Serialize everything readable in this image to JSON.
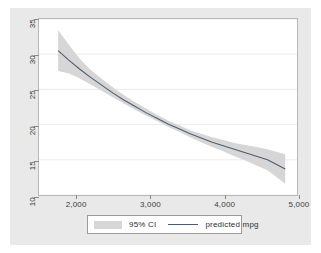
{
  "chart_data": {
    "type": "line",
    "title": "",
    "subtitle": "",
    "xlabel": "Weight (lbs.)",
    "ylabel": "",
    "xlim": [
      1500,
      5000
    ],
    "ylim": [
      10,
      35
    ],
    "xticks": [
      2000,
      3000,
      4000,
      5000
    ],
    "xticklabels": [
      "2,000",
      "3,000",
      "4,000",
      "5,000"
    ],
    "yticks": [
      10,
      15,
      20,
      25,
      30,
      35
    ],
    "yticklabels": [
      "10",
      "15",
      "20",
      "25",
      "30",
      "35"
    ],
    "grid": "horizontal",
    "legend_position": "bottom",
    "legend": [
      {
        "label": "95% CI",
        "marker": "band",
        "color": "#d6d6d6"
      },
      {
        "label": "predicted mpg",
        "marker": "line",
        "color": "#4e5d6e"
      }
    ],
    "series": [
      {
        "name": "predicted mpg",
        "type": "line",
        "color": "#4e5d6e",
        "x": [
          1760,
          1900,
          2050,
          2200,
          2350,
          2500,
          2650,
          2800,
          2950,
          3100,
          3250,
          3400,
          3550,
          3700,
          3850,
          4000,
          4150,
          4300,
          4450,
          4600,
          4840
        ],
        "y": [
          30.5,
          29.2,
          27.9,
          26.7,
          25.6,
          24.5,
          23.5,
          22.6,
          21.7,
          20.9,
          20.1,
          19.4,
          18.7,
          18.1,
          17.5,
          17.0,
          16.5,
          16.0,
          15.5,
          15.0,
          13.7
        ]
      },
      {
        "name": "95% CI",
        "type": "band",
        "color": "#d6d6d6",
        "x": [
          1760,
          1900,
          2050,
          2200,
          2350,
          2500,
          2650,
          2800,
          2950,
          3100,
          3250,
          3400,
          3550,
          3700,
          3850,
          4000,
          4150,
          4300,
          4450,
          4600,
          4840
        ],
        "lower": [
          27.6,
          27.3,
          26.6,
          25.7,
          24.8,
          23.9,
          23.0,
          22.1,
          21.3,
          20.5,
          19.7,
          19.0,
          18.2,
          17.5,
          16.8,
          16.2,
          15.5,
          14.9,
          14.2,
          13.5,
          11.6
        ],
        "upper": [
          33.4,
          31.4,
          29.4,
          27.8,
          26.5,
          25.3,
          24.2,
          23.2,
          22.3,
          21.4,
          20.6,
          19.9,
          19.2,
          18.7,
          18.2,
          17.8,
          17.4,
          17.1,
          16.8,
          16.5,
          15.8
        ]
      }
    ]
  },
  "axes": {
    "xtitle": "Weight (lbs.)"
  },
  "legend": {
    "ci_label": "95% CI",
    "pred_label": "predicted mpg"
  },
  "colors": {
    "figure_background": "#e9e9e9",
    "plot_background": "#ffffff",
    "band": "#d6d6d6",
    "line": "#4e5d6e",
    "grid": "#ececec",
    "frame": "#b9b9b9",
    "text": "#2e2e2e"
  }
}
